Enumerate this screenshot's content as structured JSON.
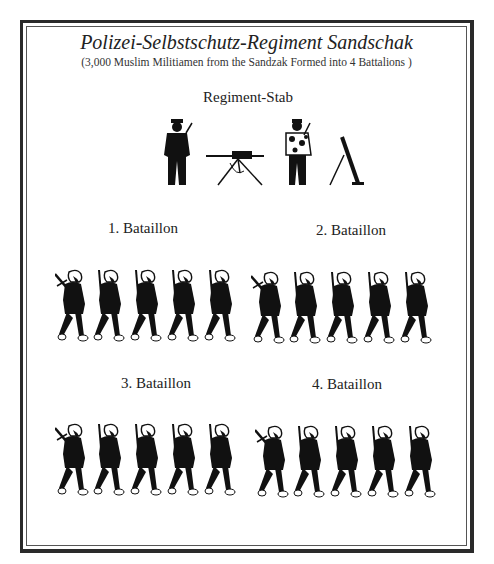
{
  "title": "Polizei-Selbstschutz-Regiment Sandschak",
  "subtitle": "(3,000 Muslim Militiamen from the Sandzak Formed into 4 Battalions )",
  "headquarters": {
    "label": "Regiment-Stab",
    "figures": [
      "officer-silhouette",
      "machine-gun-on-tripod",
      "camouflaged-soldier",
      "mortar"
    ]
  },
  "battalions": [
    {
      "label": "1. Bataillon",
      "soldiers": 5
    },
    {
      "label": "2. Bataillon",
      "soldiers": 5
    },
    {
      "label": "3. Bataillon",
      "soldiers": 5
    },
    {
      "label": "4. Bataillon",
      "soldiers": 5
    }
  ],
  "colors": {
    "ink": "#111111",
    "border": "#2a2a2a",
    "background": "#ffffff"
  }
}
